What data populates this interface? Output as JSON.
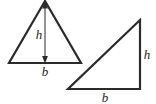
{
  "figure": {
    "title": "",
    "background_color": "#ffffff",
    "stroke_color": "#2b2b2b",
    "label_color": "#1c1c1c",
    "stroke_width": 2.2,
    "shapes": [
      {
        "name": "isosceles-triangle",
        "type": "triangle",
        "vertices": [
          [
            45,
            1
          ],
          [
            9,
            63
          ],
          [
            81,
            63
          ]
        ],
        "annotations": [
          {
            "name": "height-arrow",
            "type": "double-arrow",
            "from": [
              45,
              3
            ],
            "to": [
              45,
              62
            ],
            "label": "h",
            "label_x": 40,
            "label_y": 29
          },
          {
            "name": "base-label",
            "type": "label",
            "label": "b",
            "label_x": 45,
            "label_y": 66
          }
        ]
      },
      {
        "name": "right-triangle",
        "type": "triangle",
        "vertices": [
          [
            140,
            20
          ],
          [
            140,
            89
          ],
          [
            68,
            89
          ]
        ],
        "annotations": [
          {
            "name": "height-label",
            "type": "label",
            "label": "h",
            "label_x": 147,
            "label_y": 49
          },
          {
            "name": "base-label",
            "type": "label",
            "label": "b",
            "label_x": 105,
            "label_y": 92
          }
        ]
      }
    ],
    "labels": {
      "height_symbol": "h",
      "base_symbol": "b"
    }
  }
}
